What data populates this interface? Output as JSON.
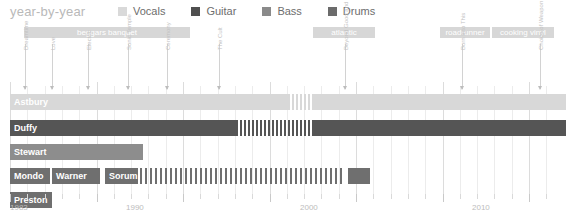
{
  "header": {
    "title": "year-by-year",
    "legend": [
      {
        "label": "Vocals",
        "color": "#d9d9d9"
      },
      {
        "label": "Guitar",
        "color": "#4f4f4f"
      },
      {
        "label": "Bass",
        "color": "#8a8a8a"
      },
      {
        "label": "Drums",
        "color": "#6b6b6b"
      }
    ]
  },
  "banners": [
    {
      "label": "beggars banquet",
      "x": 24,
      "w": 166
    },
    {
      "label": "atlantic",
      "x": 313,
      "w": 62
    },
    {
      "label": "roadrunner",
      "x": 440,
      "w": 50
    },
    {
      "label": "cooking vinyl",
      "x": 492,
      "w": 62
    }
  ],
  "album_markers": [
    {
      "label": "Dreamtime",
      "x": 25
    },
    {
      "label": "Love",
      "x": 52
    },
    {
      "label": "Electric",
      "x": 88
    },
    {
      "label": "Sonic Temple",
      "x": 128
    },
    {
      "label": "Ceremony",
      "x": 167
    },
    {
      "label": "The Cult",
      "x": 219
    },
    {
      "label": "Beyond Good and Evil",
      "x": 345
    },
    {
      "label": "Born Into This",
      "x": 462
    },
    {
      "label": "Choice of Weapon",
      "x": 540
    }
  ],
  "rows": [
    {
      "name": "Astbury",
      "y": 70,
      "color": "#d8d8d8",
      "label_color": "#ffffff",
      "segments": [
        {
          "x": 10,
          "w": 280
        }
      ],
      "stripes": {
        "x": 292,
        "w": 22,
        "gap": 4,
        "color": "#d8d8d8"
      },
      "tail": {
        "x": 314,
        "w": 252
      }
    },
    {
      "name": "Duffy",
      "y": 96,
      "color": "#555555",
      "label_color": "#ffffff",
      "segments": [
        {
          "x": 10,
          "w": 228
        }
      ],
      "stripes": {
        "x": 240,
        "w": 74,
        "gap": 4,
        "color": "#555555"
      },
      "tail": {
        "x": 314,
        "w": 252
      }
    },
    {
      "name": "Stewart",
      "y": 120,
      "color": "#8d8d8d",
      "label_color": "#ffffff",
      "segments": [
        {
          "x": 10,
          "w": 133
        }
      ],
      "stripes": null,
      "tail": null
    },
    {
      "name": "Mondo",
      "y": 144,
      "color": "#6f6f6f",
      "label_color": "#ffffff",
      "segments": [
        {
          "x": 10,
          "w": 40,
          "label": "Mondo"
        },
        {
          "x": 52,
          "w": 48,
          "label": "Warner"
        },
        {
          "x": 105,
          "w": 33,
          "label": "Sorum"
        }
      ],
      "stripes": {
        "x": 140,
        "w": 205,
        "gap": 5,
        "color": "#6f6f6f"
      },
      "tail": {
        "x": 348,
        "w": 22
      }
    },
    {
      "name": "Preston",
      "y": 168,
      "color": "#6f6f6f",
      "label_color": "#ffffff",
      "segments": [
        {
          "x": 10,
          "w": 42
        }
      ],
      "stripes": null,
      "tail": null
    }
  ],
  "axis": {
    "years": [
      {
        "label": "1983",
        "x": 10
      },
      {
        "label": "1990",
        "x": 126
      },
      {
        "label": "2000",
        "x": 300
      },
      {
        "label": "2010",
        "x": 472
      }
    ],
    "tick_start": 10,
    "tick_spacing": 17.3,
    "tick_count": 32
  }
}
